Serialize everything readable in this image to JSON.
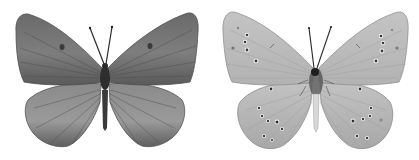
{
  "image": {
    "width": 419,
    "height": 160,
    "background": "#ffffff"
  },
  "specimens": [
    {
      "view": "upperside",
      "position": "left",
      "wing_color": "#6f6f6f",
      "wing_light": "#9a9a9a",
      "vein_color": "#4a4a4a",
      "body_color": "#2e2e2e",
      "discal_spots": 2,
      "marginal_spots": 0
    },
    {
      "view": "underside",
      "position": "right",
      "wing_color": "#b9b9b9",
      "wing_light": "#d6d6d6",
      "vein_color": "#9a9a9a",
      "body_color": "#3a3a3a",
      "spot_color": "#3c3c3c",
      "spot_ring": "#f2f2f2",
      "forewing_spots_per_side": 6,
      "hindwing_spots_per_side": 8
    }
  ]
}
